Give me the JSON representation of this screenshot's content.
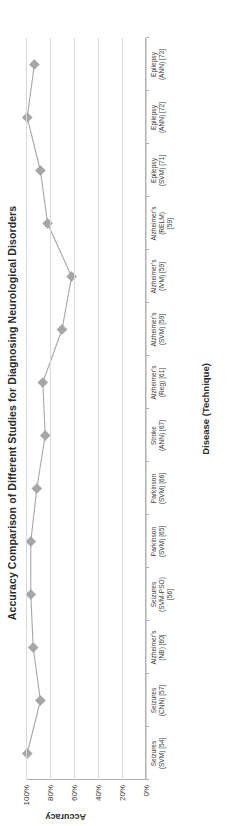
{
  "chart_data": {
    "type": "line",
    "title": "Accuracy Comparison of Different Studies for Diagnosing Neurological Disorders",
    "xlabel": "Disease (Technique)",
    "ylabel": "Accuracy",
    "ylim": [
      0,
      100
    ],
    "yticks": [
      "0%",
      "20%",
      "40%",
      "60%",
      "80%",
      "100%"
    ],
    "ytick_values": [
      0,
      20,
      40,
      60,
      80,
      100
    ],
    "grid": true,
    "legend": "none",
    "marker": "diamond",
    "series_color": "#a6a6a6",
    "categories": [
      {
        "line1": "Seizures",
        "line2": "(SVM) [54]",
        "line3": ""
      },
      {
        "line1": "Seizures",
        "line2": "(CNN) [57]",
        "line3": ""
      },
      {
        "line1": "Alzheimer's",
        "line2": "(NB) [60]",
        "line3": ""
      },
      {
        "line1": "Seizures",
        "line2": "(SVM-PSO)",
        "line3": "[56]"
      },
      {
        "line1": "Parkinson",
        "line2": "(SVM) [65]",
        "line3": ""
      },
      {
        "line1": "Parkinson",
        "line2": "(SVM) [66]",
        "line3": ""
      },
      {
        "line1": "Stroke",
        "line2": "(ANN) [67]",
        "line3": ""
      },
      {
        "line1": "Alzheimer's",
        "line2": "(Reg) [61]",
        "line3": ""
      },
      {
        "line1": "Alzheimer's",
        "line2": "(SVM) [59]",
        "line3": ""
      },
      {
        "line1": "Alzheimer's",
        "line2": "(IVM) [59]",
        "line3": ""
      },
      {
        "line1": "Alzheimer's",
        "line2": "(RELM)",
        "line3": "[59]"
      },
      {
        "line1": "Epilepsy",
        "line2": "(SVM) [71]",
        "line3": ""
      },
      {
        "line1": "Epilepsy",
        "line2": "(ANN) [72]",
        "line3": ""
      },
      {
        "line1": "Epilepsy",
        "line2": "(ANN) [73]",
        "line3": ""
      }
    ],
    "values": [
      99,
      88,
      94,
      96,
      96,
      91,
      84,
      86,
      70,
      62,
      82,
      88,
      99,
      93
    ]
  }
}
